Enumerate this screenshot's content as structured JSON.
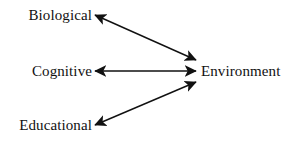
{
  "figure": {
    "background_color": "#ffffff",
    "line_color": "#111111",
    "text_color": "#111111"
  },
  "nodes": {
    "biological": "Biological",
    "cognitive": "Cognitive",
    "educational": "Educational",
    "environment": "Environment"
  },
  "connectors": [
    {
      "id": "biological-environment",
      "from": "Biological",
      "to": "Environment",
      "direction": "bidirectional",
      "start": [
        95,
        15
      ],
      "end": [
        196,
        60
      ]
    },
    {
      "id": "cognitive-environment",
      "from": "Cognitive",
      "to": "Environment",
      "direction": "bidirectional",
      "start": [
        95,
        71
      ],
      "end": [
        196,
        71
      ]
    },
    {
      "id": "educational-environment",
      "from": "Educational",
      "to": "Environment",
      "direction": "bidirectional",
      "start": [
        95,
        125
      ],
      "end": [
        196,
        82
      ]
    }
  ]
}
